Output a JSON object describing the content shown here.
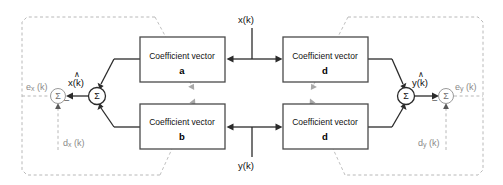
{
  "diagram": {
    "colors": {
      "line": "#2b2b2b",
      "box_border": "#4a4a4a",
      "dashed_region": "#b8b8b8",
      "dashed_arrow": "#b0b0b0",
      "text": "#111111",
      "dim_text": "#8a8a8a",
      "background": "#ffffff"
    },
    "boxes": [
      {
        "id": "a",
        "label": "Coefficient vector",
        "name": "a",
        "x": 140,
        "y": 37,
        "w": 85,
        "h": 45
      },
      {
        "id": "b",
        "label": "Coefficient vector",
        "name": "b",
        "x": 140,
        "y": 104,
        "w": 85,
        "h": 45
      },
      {
        "id": "c",
        "label": "Coefficient vector",
        "name": "c",
        "x": 283,
        "y": 37,
        "w": 85,
        "h": 45
      },
      {
        "id": "d",
        "label": "Coefficient vector",
        "name": "d",
        "x": 283,
        "y": 104,
        "w": 85,
        "h": 45
      }
    ],
    "summers": [
      {
        "id": "sum-x-main",
        "symbol": "Σ",
        "cx": 97,
        "cy": 96
      },
      {
        "id": "sum-x-error",
        "symbol": "Σ",
        "cx": 58,
        "cy": 96
      },
      {
        "id": "sum-y-main",
        "symbol": "Σ",
        "cx": 406,
        "cy": 96
      },
      {
        "id": "sum-y-error",
        "symbol": "Σ",
        "cx": 446,
        "cy": 96
      }
    ],
    "signals": {
      "input_x": "x(k)",
      "input_y": "y(k)",
      "estimate_x": "x(k)",
      "estimate_y": "y(k)",
      "error_x_base": "e",
      "error_x_sub": "x",
      "error_x_tail": " (k)",
      "error_y_base": "e",
      "error_y_sub": "y",
      "error_y_tail": " (k)",
      "desired_x_base": "d",
      "desired_x_sub": "x",
      "desired_x_tail": " (k)",
      "desired_y_base": "d",
      "desired_y_sub": "y",
      "desired_y_tail": " (k)",
      "hat_symbol": "∧",
      "minus_sign": "−"
    },
    "regions": [
      {
        "id": "left-adaptation-region",
        "x": 22,
        "y": 16,
        "w": 138,
        "h": 159
      },
      {
        "id": "right-adaptation-region",
        "x": 358,
        "y": 17,
        "w": 125,
        "h": 158
      }
    ]
  }
}
